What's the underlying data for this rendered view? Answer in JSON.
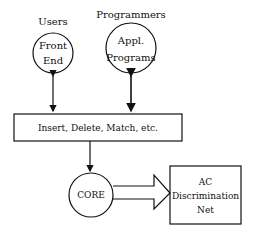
{
  "diagram": {
    "nodes": {
      "users_label": "Users",
      "programmers_label": "Programmers",
      "front_end": [
        "Front",
        "End"
      ],
      "appl_programs": [
        "Appl.",
        "Programs"
      ],
      "operations_box": "Insert, Delete, Match, etc.",
      "core": "CORE",
      "ac_net": [
        "AC",
        "Discrimination",
        "Net"
      ]
    },
    "edges": [
      {
        "from": "Front End",
        "to": "Insert, Delete, Match, etc.",
        "type": "bidirectional"
      },
      {
        "from": "Appl. Programs",
        "to": "Insert, Delete, Match, etc.",
        "type": "bidirectional"
      },
      {
        "from": "Insert, Delete, Match, etc.",
        "to": "CORE",
        "type": "directed"
      },
      {
        "from": "CORE",
        "to": "AC Discrimination Net",
        "type": "block-arrow"
      }
    ]
  }
}
